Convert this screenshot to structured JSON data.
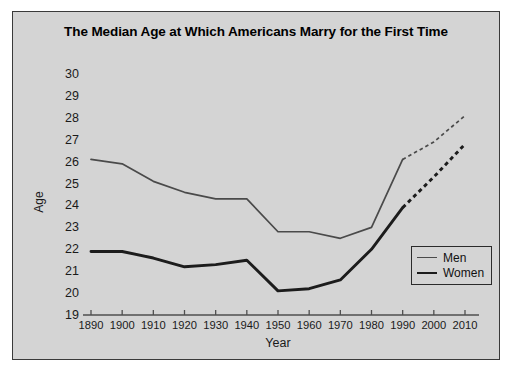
{
  "chart_data": {
    "type": "line",
    "title": "The Median Age at Which Americans Marry for the First Time",
    "xlabel": "Year",
    "ylabel": "Age",
    "xlim": [
      1890,
      2010
    ],
    "ylim": [
      19,
      30
    ],
    "grid": false,
    "legend_position": "lower right",
    "xticks": [
      1890,
      1900,
      1910,
      1920,
      1930,
      1940,
      1950,
      1960,
      1970,
      1980,
      1990,
      2000,
      2010
    ],
    "yticks": [
      19,
      20,
      21,
      22,
      23,
      24,
      25,
      26,
      27,
      28,
      29,
      30
    ],
    "x": [
      1890,
      1900,
      1910,
      1920,
      1930,
      1940,
      1950,
      1960,
      1970,
      1980,
      1990,
      2000,
      2010
    ],
    "series": [
      {
        "name": "Men",
        "color": "#4a4a4a",
        "values": [
          26.1,
          25.9,
          25.1,
          24.6,
          24.3,
          24.3,
          22.8,
          22.8,
          22.5,
          23.0,
          26.1,
          26.9,
          28.1
        ],
        "solid_through": 1990,
        "projected_from": 1990
      },
      {
        "name": "Women",
        "color": "#1c1c1c",
        "values": [
          21.9,
          21.9,
          21.6,
          21.2,
          21.3,
          21.5,
          20.1,
          20.2,
          20.6,
          22.0,
          23.9,
          25.3,
          26.8
        ],
        "solid_through": 1990,
        "projected_from": 1990
      }
    ]
  },
  "legend": {
    "items": [
      {
        "label": "Men"
      },
      {
        "label": "Women"
      }
    ]
  }
}
